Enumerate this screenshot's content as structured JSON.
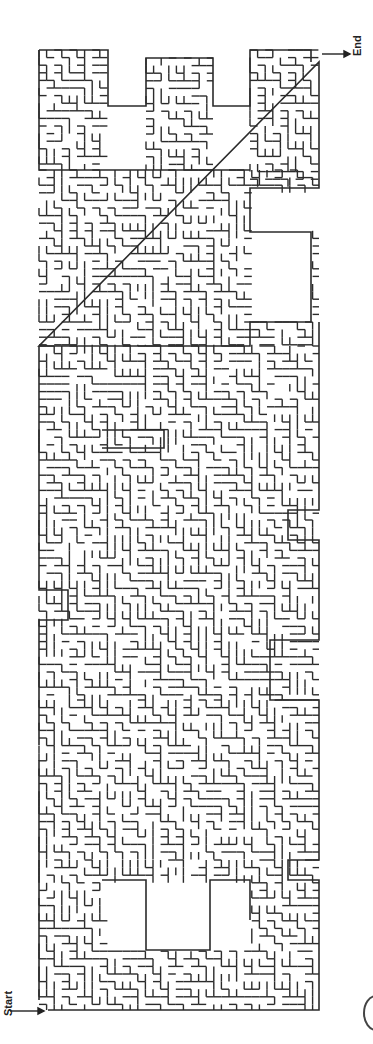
{
  "puzzle": {
    "type": "maze",
    "shape_word": "EXAMPLE",
    "orientation": "rotated 90 degrees",
    "start_label": "Start",
    "end_label": "End",
    "wall_color": "#2b2b2b",
    "background_color": "#ffffff",
    "page_mark": "circle"
  }
}
